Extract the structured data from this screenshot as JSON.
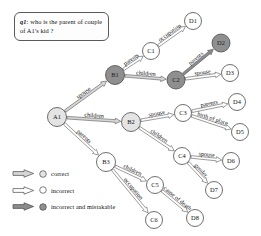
{
  "question": {
    "id_label": "q1",
    "text": ": who is the parent of couple of A1's kid ?"
  },
  "legend": {
    "items": [
      {
        "label": "correct",
        "arrow_style": "correct",
        "node_style": "correct",
        "arrow_fill": "#d6d6d6",
        "node_fill": "#e4e4e4"
      },
      {
        "label": "incorrect",
        "arrow_style": "incorrect",
        "node_style": "incorrect",
        "arrow_fill": "#ffffff",
        "node_fill": "#ffffff"
      },
      {
        "label": "incorrect and mistakable",
        "arrow_style": "mistakable",
        "node_style": "mistakable",
        "arrow_fill": "#8c8c8c",
        "node_fill": "#8f8f8f"
      }
    ]
  },
  "graph_data": {
    "type": "diagram",
    "colors": {
      "correct_fill": "#e4e4e4",
      "incorrect_fill": "#ffffff",
      "mistakable_fill": "#8f8f8f",
      "stroke": "#4a4a4a",
      "label_text": "#111111",
      "node_text_light": "#111111",
      "node_text_dark": "#1d1d1d"
    },
    "nodes": [
      {
        "id": "A1",
        "label": "A1",
        "x": 57,
        "y": 117,
        "r": 9.5,
        "style": "correct"
      },
      {
        "id": "B1",
        "label": "B1",
        "x": 115,
        "y": 75,
        "r": 9.5,
        "style": "mistakable"
      },
      {
        "id": "B2",
        "label": "B2",
        "x": 131,
        "y": 122,
        "r": 9.5,
        "style": "correct"
      },
      {
        "id": "B3",
        "label": "B3",
        "x": 106,
        "y": 162,
        "r": 9.5,
        "style": "incorrect"
      },
      {
        "id": "C1",
        "label": "C1",
        "x": 151,
        "y": 51,
        "r": 8.5,
        "style": "incorrect"
      },
      {
        "id": "C2",
        "label": "C2",
        "x": 176,
        "y": 80,
        "r": 9,
        "style": "mistakable"
      },
      {
        "id": "C3",
        "label": "C3",
        "x": 183,
        "y": 113,
        "r": 8.5,
        "style": "incorrect"
      },
      {
        "id": "C4",
        "label": "C4",
        "x": 182,
        "y": 156,
        "r": 8.5,
        "style": "incorrect"
      },
      {
        "id": "C5",
        "label": "C5",
        "x": 155,
        "y": 185,
        "r": 8.5,
        "style": "incorrect"
      },
      {
        "id": "C6",
        "label": "C6",
        "x": 154,
        "y": 220,
        "r": 8.5,
        "style": "incorrect"
      },
      {
        "id": "D1",
        "label": "D1",
        "x": 193,
        "y": 21,
        "r": 8.5,
        "style": "incorrect"
      },
      {
        "id": "D2",
        "label": "D2",
        "x": 221,
        "y": 43,
        "r": 9,
        "style": "mistakable"
      },
      {
        "id": "D3",
        "label": "D3",
        "x": 230,
        "y": 73,
        "r": 8.5,
        "style": "incorrect"
      },
      {
        "id": "D4",
        "label": "D4",
        "x": 237,
        "y": 102,
        "r": 8.5,
        "style": "incorrect"
      },
      {
        "id": "D5",
        "label": "D5",
        "x": 240,
        "y": 132,
        "r": 8.5,
        "style": "incorrect"
      },
      {
        "id": "D6",
        "label": "D6",
        "x": 231,
        "y": 161,
        "r": 8.5,
        "style": "incorrect"
      },
      {
        "id": "D7",
        "label": "D7",
        "x": 214,
        "y": 190,
        "r": 8.5,
        "style": "incorrect"
      },
      {
        "id": "D8",
        "label": "D8",
        "x": 195,
        "y": 218,
        "r": 8.5,
        "style": "incorrect"
      }
    ],
    "edges": [
      {
        "from": "A1",
        "to": "B1",
        "label": "spouse",
        "style": "correct"
      },
      {
        "from": "A1",
        "to": "B2",
        "label": "children",
        "style": "correct"
      },
      {
        "from": "A1",
        "to": "B3",
        "label": "parents",
        "style": "incorrect"
      },
      {
        "from": "B1",
        "to": "C1",
        "label": "parents",
        "style": "incorrect"
      },
      {
        "from": "B1",
        "to": "C2",
        "label": "children",
        "style": "correct"
      },
      {
        "from": "B2",
        "to": "C3",
        "label": "spouse",
        "style": "incorrect"
      },
      {
        "from": "B2",
        "to": "C4",
        "label": "children",
        "style": "incorrect"
      },
      {
        "from": "B3",
        "to": "C5",
        "label": "children",
        "style": "incorrect"
      },
      {
        "from": "B3",
        "to": "C6",
        "label": "occupation",
        "style": "incorrect"
      },
      {
        "from": "C1",
        "to": "D1",
        "label": "occupation",
        "style": "incorrect"
      },
      {
        "from": "C2",
        "to": "D2",
        "label": "parents",
        "style": "mistakable"
      },
      {
        "from": "C2",
        "to": "D3",
        "label": "spouse",
        "style": "incorrect"
      },
      {
        "from": "C3",
        "to": "D4",
        "label": "parents",
        "style": "incorrect"
      },
      {
        "from": "C3",
        "to": "D5",
        "label": "birth of place",
        "style": "incorrect"
      },
      {
        "from": "C4",
        "to": "D6",
        "label": "spouse",
        "style": "incorrect"
      },
      {
        "from": "C4",
        "to": "D7",
        "label": "gender",
        "style": "incorrect"
      },
      {
        "from": "C5",
        "to": "D8",
        "label": "cause of death",
        "style": "incorrect"
      }
    ]
  }
}
